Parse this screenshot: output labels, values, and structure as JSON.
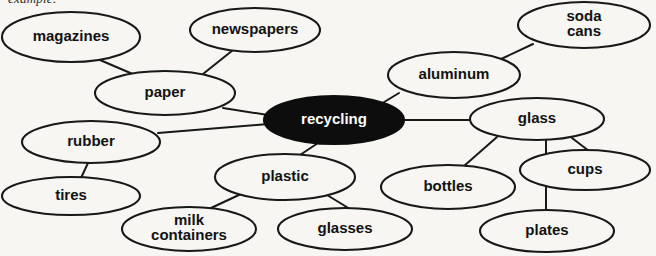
{
  "caption": {
    "text": "example:",
    "note": "clipped at top edge of scan"
  },
  "diagram": {
    "title": "recycling",
    "type": "concept-web",
    "colors": {
      "background": "#f7f6f3",
      "stroke": "#181818",
      "node_fill": "#f7f6f3",
      "center_fill": "#0d0d0d",
      "center_text": "#ffffff",
      "label_text": "#121212"
    },
    "center_node": {
      "id": "recycling",
      "label": "recycling",
      "cx": 334,
      "cy": 120,
      "rx": 70,
      "ry": 24,
      "filled": true
    },
    "nodes": [
      {
        "id": "magazines",
        "label": "magazines",
        "lines": [
          "magazines"
        ],
        "cx": 71,
        "cy": 37,
        "rx": 69,
        "ry": 25
      },
      {
        "id": "newspapers",
        "label": "newspapers",
        "lines": [
          "newspapers"
        ],
        "cx": 255,
        "cy": 30,
        "rx": 65,
        "ry": 22
      },
      {
        "id": "paper",
        "label": "paper",
        "lines": [
          "paper"
        ],
        "cx": 165,
        "cy": 93,
        "rx": 70,
        "ry": 22
      },
      {
        "id": "soda-cans",
        "label": "soda cans",
        "lines": [
          "soda",
          "cans"
        ],
        "cx": 584,
        "cy": 25,
        "rx": 66,
        "ry": 23
      },
      {
        "id": "aluminum",
        "label": "aluminum",
        "lines": [
          "aluminum"
        ],
        "cx": 454,
        "cy": 75,
        "rx": 66,
        "ry": 23
      },
      {
        "id": "glass",
        "label": "glass",
        "lines": [
          "glass"
        ],
        "cx": 537,
        "cy": 119,
        "rx": 67,
        "ry": 21
      },
      {
        "id": "cups",
        "label": "cups",
        "lines": [
          "cups"
        ],
        "cx": 585,
        "cy": 170,
        "rx": 65,
        "ry": 20
      },
      {
        "id": "bottles",
        "label": "bottles",
        "lines": [
          "bottles"
        ],
        "cx": 448,
        "cy": 187,
        "rx": 67,
        "ry": 22
      },
      {
        "id": "plates",
        "label": "plates",
        "lines": [
          "plates"
        ],
        "cx": 547,
        "cy": 231,
        "rx": 67,
        "ry": 21
      },
      {
        "id": "rubber",
        "label": "rubber",
        "lines": [
          "rubber"
        ],
        "cx": 91,
        "cy": 142,
        "rx": 69,
        "ry": 21
      },
      {
        "id": "tires",
        "label": "tires",
        "lines": [
          "tires"
        ],
        "cx": 71,
        "cy": 196,
        "rx": 69,
        "ry": 19
      },
      {
        "id": "plastic",
        "label": "plastic",
        "lines": [
          "plastic"
        ],
        "cx": 285,
        "cy": 177,
        "rx": 70,
        "ry": 23
      },
      {
        "id": "milk-containers",
        "label": "milk containers",
        "lines": [
          "milk",
          "containers"
        ],
        "cx": 189,
        "cy": 229,
        "rx": 67,
        "ry": 22
      },
      {
        "id": "glasses",
        "label": "glasses",
        "lines": [
          "glasses"
        ],
        "cx": 345,
        "cy": 229,
        "rx": 67,
        "ry": 21
      }
    ],
    "links": [
      {
        "from": "magazines",
        "to": "paper",
        "x1": 100,
        "y1": 60,
        "x2": 135,
        "y2": 75
      },
      {
        "from": "newspapers",
        "to": "paper",
        "x1": 233,
        "y1": 50,
        "x2": 203,
        "y2": 74
      },
      {
        "from": "paper",
        "to": "recycling",
        "x1": 223,
        "y1": 108,
        "x2": 274,
        "y2": 116
      },
      {
        "from": "soda-cans",
        "to": "aluminum",
        "x1": 533,
        "y1": 44,
        "x2": 499,
        "y2": 60
      },
      {
        "from": "aluminum",
        "to": "recycling",
        "x1": 399,
        "y1": 93,
        "x2": 376,
        "y2": 107
      },
      {
        "from": "recycling",
        "to": "glass",
        "x1": 404,
        "y1": 120,
        "x2": 472,
        "y2": 120
      },
      {
        "from": "glass",
        "to": "bottles",
        "x1": 497,
        "y1": 137,
        "x2": 464,
        "y2": 166
      },
      {
        "from": "glass",
        "to": "plates",
        "x1": 546,
        "y1": 140,
        "x2": 546,
        "y2": 211
      },
      {
        "from": "glass",
        "to": "cups",
        "x1": 572,
        "y1": 138,
        "x2": 589,
        "y2": 151
      },
      {
        "from": "rubber",
        "to": "recycling",
        "x1": 158,
        "y1": 133,
        "x2": 268,
        "y2": 124
      },
      {
        "from": "rubber",
        "to": "tires",
        "x1": 88,
        "y1": 163,
        "x2": 81,
        "y2": 178
      },
      {
        "from": "plastic",
        "to": "recycling",
        "x1": 300,
        "y1": 155,
        "x2": 318,
        "y2": 143
      },
      {
        "from": "plastic",
        "to": "milk-containers",
        "x1": 241,
        "y1": 194,
        "x2": 211,
        "y2": 208
      },
      {
        "from": "plastic",
        "to": "glasses",
        "x1": 327,
        "y1": 195,
        "x2": 350,
        "y2": 209
      }
    ]
  }
}
